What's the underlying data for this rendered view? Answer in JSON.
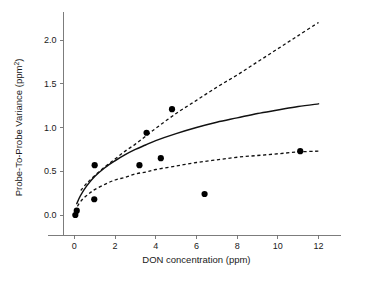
{
  "chart_data": {
    "type": "scatter",
    "title": "",
    "subtitle": "",
    "xlabel": "DON concentration (ppm)",
    "ylabel": "Probe-To-Probe Variance (ppm²)",
    "ylabel_base": "Probe-To-Probe Variance (ppm",
    "ylabel_exponent": "2",
    "ylabel_close": ")",
    "xlim": [
      -0.9,
      13.3
    ],
    "ylim": [
      -0.32,
      2.32
    ],
    "xticks": [
      0,
      2,
      4,
      6,
      8,
      10,
      12
    ],
    "xtick_labels": [
      "0",
      "2",
      "4",
      "6",
      "8",
      "10",
      "12"
    ],
    "yticks": [
      0.0,
      0.5,
      1.0,
      1.5,
      2.0
    ],
    "ytick_labels": [
      "0.0",
      "0.5",
      "1.0",
      "1.5",
      "2.0"
    ],
    "grid": false,
    "legend": false,
    "legend_position": "none",
    "marker": "filled-circle",
    "marker_color": "#000000",
    "points": [
      {
        "x": 0.05,
        "y": 0.0
      },
      {
        "x": 0.12,
        "y": 0.05
      },
      {
        "x": 0.98,
        "y": 0.18
      },
      {
        "x": 1.0,
        "y": 0.57
      },
      {
        "x": 3.2,
        "y": 0.57
      },
      {
        "x": 3.55,
        "y": 0.94
      },
      {
        "x": 4.25,
        "y": 0.65
      },
      {
        "x": 4.8,
        "y": 1.21
      },
      {
        "x": 6.4,
        "y": 0.24
      },
      {
        "x": 11.1,
        "y": 0.73
      }
    ],
    "series": [
      {
        "name": "fit",
        "style": "solid",
        "color": "#111111",
        "points": [
          {
            "x": 0.12,
            "y": 0.13
          },
          {
            "x": 0.3,
            "y": 0.22
          },
          {
            "x": 0.6,
            "y": 0.33
          },
          {
            "x": 1.0,
            "y": 0.44
          },
          {
            "x": 1.5,
            "y": 0.54
          },
          {
            "x": 2.0,
            "y": 0.62
          },
          {
            "x": 2.5,
            "y": 0.69
          },
          {
            "x": 3.0,
            "y": 0.75
          },
          {
            "x": 3.5,
            "y": 0.8
          },
          {
            "x": 4.0,
            "y": 0.85
          },
          {
            "x": 5.0,
            "y": 0.93
          },
          {
            "x": 6.0,
            "y": 1.0
          },
          {
            "x": 7.0,
            "y": 1.06
          },
          {
            "x": 8.0,
            "y": 1.11
          },
          {
            "x": 9.0,
            "y": 1.16
          },
          {
            "x": 10.0,
            "y": 1.2
          },
          {
            "x": 11.0,
            "y": 1.24
          },
          {
            "x": 12.0,
            "y": 1.27
          }
        ]
      },
      {
        "name": "upper-confidence-band",
        "style": "dashed",
        "color": "#111111",
        "points": [
          {
            "x": 0.32,
            "y": 0.28
          },
          {
            "x": 0.6,
            "y": 0.36
          },
          {
            "x": 1.0,
            "y": 0.45
          },
          {
            "x": 1.5,
            "y": 0.55
          },
          {
            "x": 2.0,
            "y": 0.64
          },
          {
            "x": 2.5,
            "y": 0.73
          },
          {
            "x": 3.0,
            "y": 0.81
          },
          {
            "x": 3.5,
            "y": 0.9
          },
          {
            "x": 4.0,
            "y": 0.99
          },
          {
            "x": 5.0,
            "y": 1.16
          },
          {
            "x": 6.0,
            "y": 1.31
          },
          {
            "x": 7.0,
            "y": 1.46
          },
          {
            "x": 8.0,
            "y": 1.6
          },
          {
            "x": 9.0,
            "y": 1.75
          },
          {
            "x": 10.0,
            "y": 1.9
          },
          {
            "x": 11.0,
            "y": 2.05
          },
          {
            "x": 12.0,
            "y": 2.2
          }
        ]
      },
      {
        "name": "lower-confidence-band",
        "style": "dashed",
        "color": "#111111",
        "points": [
          {
            "x": 0.15,
            "y": 0.1
          },
          {
            "x": 0.4,
            "y": 0.18
          },
          {
            "x": 0.7,
            "y": 0.24
          },
          {
            "x": 1.0,
            "y": 0.29
          },
          {
            "x": 1.5,
            "y": 0.35
          },
          {
            "x": 2.0,
            "y": 0.4
          },
          {
            "x": 2.5,
            "y": 0.43
          },
          {
            "x": 3.0,
            "y": 0.47
          },
          {
            "x": 3.5,
            "y": 0.49
          },
          {
            "x": 4.0,
            "y": 0.52
          },
          {
            "x": 5.0,
            "y": 0.56
          },
          {
            "x": 6.0,
            "y": 0.6
          },
          {
            "x": 7.0,
            "y": 0.63
          },
          {
            "x": 8.0,
            "y": 0.66
          },
          {
            "x": 9.0,
            "y": 0.68
          },
          {
            "x": 10.0,
            "y": 0.7
          },
          {
            "x": 11.0,
            "y": 0.72
          },
          {
            "x": 12.0,
            "y": 0.73
          }
        ]
      }
    ]
  }
}
